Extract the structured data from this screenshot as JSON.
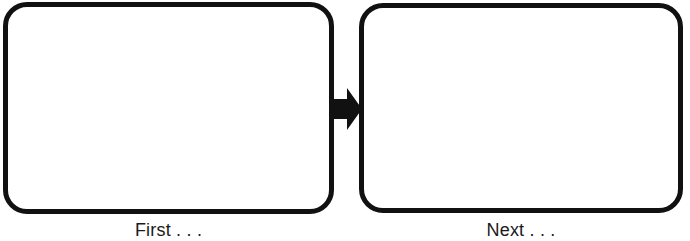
{
  "figure": {
    "background_color": "#ffffff",
    "stroke_color": "#111111",
    "text_color": "#1a1a1a",
    "width": 690,
    "height": 241
  },
  "panels": [
    {
      "id": "first",
      "caption": "First . . .",
      "content": "",
      "shape": "rounded-rectangle",
      "fill": "#ffffff"
    },
    {
      "id": "next",
      "caption": "Next . . .",
      "content": "",
      "shape": "rounded-rectangle",
      "fill": "#ffffff"
    }
  ],
  "connector": {
    "icon": "arrow-right-icon",
    "direction": "right",
    "color": "#111111"
  }
}
